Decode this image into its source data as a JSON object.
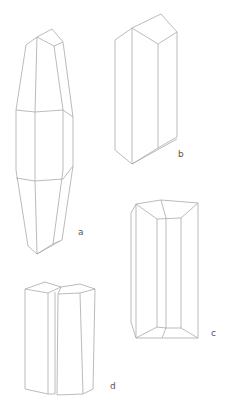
{
  "figure": {
    "line_color": "#a9a9a9",
    "background": "#ffffff",
    "crystals": [
      {
        "id": "a",
        "label": "a"
      },
      {
        "id": "b",
        "label": "b"
      },
      {
        "id": "c",
        "label": "c"
      },
      {
        "id": "d",
        "label": "d"
      }
    ]
  }
}
